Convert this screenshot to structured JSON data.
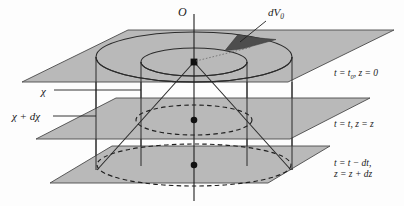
{
  "figure": {
    "type": "geometric-diagram",
    "colors": {
      "plane_fill": "#b9b9b9",
      "plane_stroke": "#4a4a4a",
      "wedge_fill": "#4d4d4d",
      "line": "#2b2b2b",
      "background": "#fdfdfd"
    }
  },
  "labels": {
    "origin": "O",
    "volume_element": "dV",
    "volume_element_sub": "0",
    "chi": "χ",
    "chi_plus_dchi": "χ + dχ"
  },
  "planes": [
    {
      "id": "top",
      "time_label": "t = t",
      "time_sub": "0",
      "coord_label": ", z = 0",
      "full_text": "t = t0, z = 0"
    },
    {
      "id": "middle",
      "time_label": "t = t",
      "time_sub": "",
      "coord_label": ", z = z",
      "full_text": "t = t, z = z"
    },
    {
      "id": "bottom",
      "line1": "t = t − dt,",
      "line2": "z = z + dz",
      "full_text": "t = t - dt, z = z + dz"
    }
  ],
  "geometry": {
    "axis": {
      "x": 194,
      "y_top": 14,
      "y_bottom": 201
    },
    "apex": {
      "x": 194,
      "y": 62
    },
    "dots": [
      {
        "x": 194,
        "y": 62,
        "name": "apex-dot"
      },
      {
        "x": 194,
        "y": 120,
        "name": "middle-center-dot"
      },
      {
        "x": 194,
        "y": 165,
        "name": "bottom-center-dot"
      }
    ],
    "plane_top": {
      "points": "22,82 128,30 394,30 288,82",
      "y_front": 82
    },
    "plane_mid": {
      "points": "36,139 116,98 370,98 290,139",
      "y_front": 139
    },
    "plane_bot": {
      "points": "50,183 112,146 330,146 268,183",
      "y_front": 183
    },
    "cylinder_outer": {
      "cx": 194,
      "cy": 57,
      "rx": 98,
      "ry": 25,
      "bottom_cy": 170
    },
    "cylinder_inner": {
      "cx": 194,
      "cy": 62,
      "rx": 53,
      "ry": 14,
      "bottom_cy": 166
    },
    "ellipse_mid_dashed": {
      "cx": 194,
      "cy": 120,
      "rx": 58,
      "ry": 15
    },
    "ellipse_bot_dashed": {
      "cx": 194,
      "cy": 165,
      "rx": 97,
      "ry": 21
    }
  }
}
